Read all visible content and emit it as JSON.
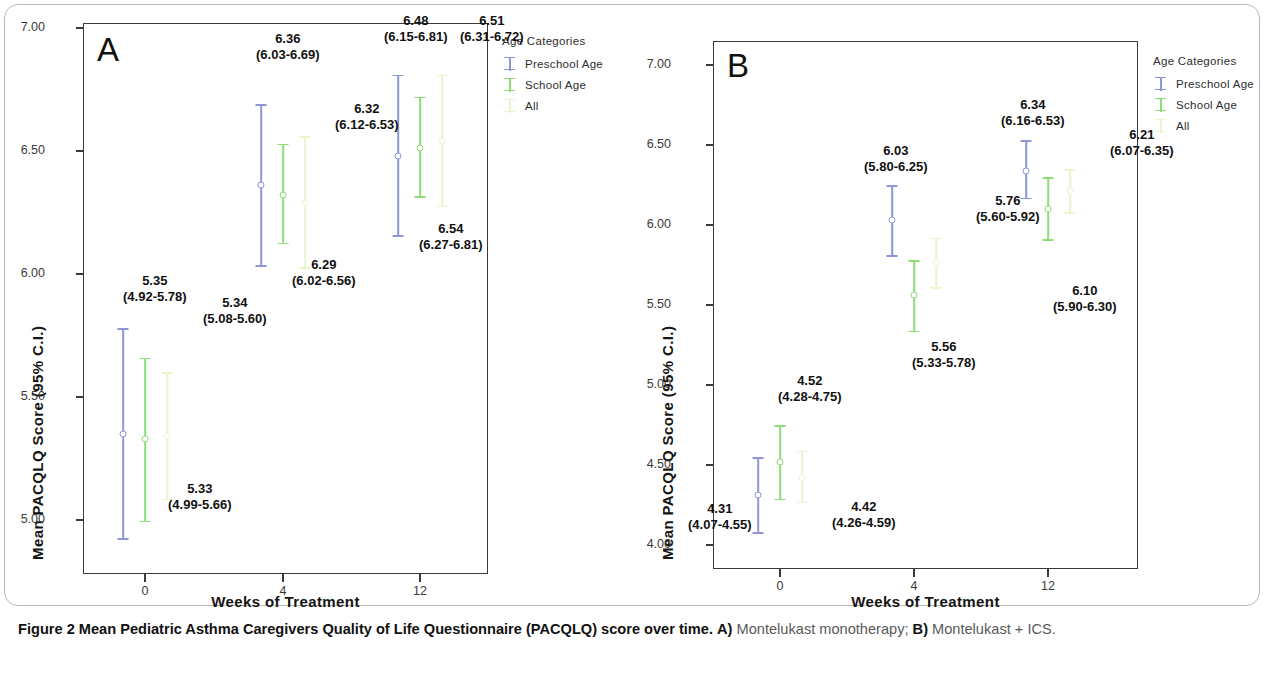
{
  "figure": {
    "caption_bold_lead": "Figure 2",
    "caption_bold_main": "Mean Pediatric Asthma Caregivers Quality of Life Questionnaire (PACQLQ) score over time.",
    "caption_a_bold": "A)",
    "caption_a_text": "Montelukast monotherapy;",
    "caption_b_bold": "B)",
    "caption_b_text": "Montelukast + ICS."
  },
  "colors": {
    "preschool": "#8f96d6",
    "school": "#8ddd77",
    "all": "#e9f5cf",
    "axis": "#3b3b3b",
    "text": "#111111"
  },
  "legend": {
    "title": "Age Categories",
    "items": [
      {
        "label": "Preschool Age",
        "color_key": "preschool"
      },
      {
        "label": "School Age",
        "color_key": "school"
      },
      {
        "label": "All",
        "color_key": "all"
      }
    ]
  },
  "axes": {
    "xlabel": "Weeks of Treatment",
    "ylabel": "Mean PACQLQ Score (95% C.I.)",
    "xticks": [
      "0",
      "4",
      "12"
    ],
    "panel_a_yticks": [
      "7.00",
      "6.50",
      "6.00",
      "5.50",
      "5.00"
    ],
    "panel_b_yticks": [
      "7.00",
      "6.50",
      "6.00",
      "5.50",
      "5.00",
      "4.50",
      "4.00"
    ]
  },
  "panels": {
    "a": {
      "letter": "A"
    },
    "b": {
      "letter": "B"
    }
  },
  "chart_data": [
    {
      "id": "panel-a",
      "type": "scatter",
      "title": "A) Montelukast monotherapy",
      "xlabel": "Weeks of Treatment",
      "ylabel": "Mean PACQLQ Score (95% C.I.)",
      "xlim": [
        -1.2,
        2.2
      ],
      "ylim": [
        4.78,
        7.02
      ],
      "x": [
        0,
        4,
        12
      ],
      "xtick_labels": [
        "0",
        "4",
        "12"
      ],
      "ytick_labels": [
        "5.00",
        "5.50",
        "6.00",
        "6.50",
        "7.00"
      ],
      "grid": false,
      "legend_position": "right",
      "series": [
        {
          "name": "Preschool Age",
          "color": "#8f96d6",
          "values": [
            5.35,
            6.36,
            6.48
          ],
          "ci_low": [
            4.92,
            6.03,
            6.15
          ],
          "ci_high": [
            5.78,
            6.69,
            6.81
          ],
          "labels": [
            "5.35",
            "6.36",
            "6.48"
          ],
          "ci_labels": [
            "(4.92-5.78)",
            "(6.03-6.69)",
            "(6.15-6.81)"
          ]
        },
        {
          "name": "School Age",
          "color": "#8ddd77",
          "values": [
            5.33,
            6.32,
            6.51
          ],
          "ci_low": [
            4.99,
            6.12,
            6.31
          ],
          "ci_high": [
            5.66,
            6.53,
            6.72
          ],
          "labels": [
            "5.33",
            "6.32",
            "6.51"
          ],
          "ci_labels": [
            "(4.99-5.66)",
            "(6.12-6.53)",
            "(6.31-6.72)"
          ]
        },
        {
          "name": "All",
          "color": "#e9f5cf",
          "values": [
            5.34,
            6.29,
            6.54
          ],
          "ci_low": [
            5.08,
            6.02,
            6.27
          ],
          "ci_high": [
            5.6,
            6.56,
            6.81
          ],
          "labels": [
            "5.34",
            "6.29",
            "6.54"
          ],
          "ci_labels": [
            "(5.08-5.60)",
            "(6.02-6.56)",
            "(6.27-6.81)"
          ]
        }
      ]
    },
    {
      "id": "panel-b",
      "type": "scatter",
      "title": "B) Montelukast + ICS",
      "xlabel": "Weeks of Treatment",
      "ylabel": "Mean PACQLQ Score (95% C.I.)",
      "xlim": [
        -1.2,
        2.2
      ],
      "ylim": [
        3.85,
        7.15
      ],
      "x": [
        0,
        4,
        12
      ],
      "xtick_labels": [
        "0",
        "4",
        "12"
      ],
      "ytick_labels": [
        "4.00",
        "4.50",
        "5.00",
        "5.50",
        "6.00",
        "6.50",
        "7.00"
      ],
      "grid": false,
      "legend_position": "right",
      "series": [
        {
          "name": "Preschool Age",
          "color": "#8f96d6",
          "values": [
            4.31,
            6.03,
            6.34
          ],
          "ci_low": [
            4.07,
            5.8,
            6.16
          ],
          "ci_high": [
            4.55,
            6.25,
            6.53
          ],
          "labels": [
            "4.31",
            "6.03",
            "6.34"
          ],
          "ci_labels": [
            "(4.07-4.55)",
            "(5.80-6.25)",
            "(6.16-6.53)"
          ]
        },
        {
          "name": "School Age",
          "color": "#8ddd77",
          "values": [
            4.52,
            5.56,
            6.1
          ],
          "ci_low": [
            4.28,
            5.33,
            5.9
          ],
          "ci_high": [
            4.75,
            5.78,
            6.3
          ],
          "labels": [
            "4.52",
            "5.56",
            "6.10"
          ],
          "ci_labels": [
            "(4.28-4.75)",
            "(5.33-5.78)",
            "(5.90-6.30)"
          ]
        },
        {
          "name": "All",
          "color": "#e9f5cf",
          "values": [
            4.42,
            5.76,
            6.21
          ],
          "ci_low": [
            4.26,
            5.6,
            6.07
          ],
          "ci_high": [
            4.59,
            5.92,
            6.35
          ],
          "labels": [
            "4.42",
            "5.76",
            "6.21"
          ],
          "ci_labels": [
            "(4.26-4.59)",
            "(5.60-5.92)",
            "(6.07-6.35)"
          ]
        }
      ]
    }
  ],
  "annotations": {
    "panel_a": [
      {
        "text": "5.35",
        "ci": "(4.92-5.78)",
        "x": 118,
        "y": 268
      },
      {
        "text": "5.33",
        "ci": "(4.99-5.66)",
        "x": 163,
        "y": 476
      },
      {
        "text": "5.34",
        "ci": "(5.08-5.60)",
        "x": 198,
        "y": 290
      },
      {
        "text": "6.36",
        "ci": "(6.03-6.69)",
        "x": 251,
        "y": 26
      },
      {
        "text": "6.32",
        "ci": "(6.12-6.53)",
        "x": 330,
        "y": 96
      },
      {
        "text": "6.29",
        "ci": "(6.02-6.56)",
        "x": 287,
        "y": 252
      },
      {
        "text": "6.48",
        "ci": "(6.15-6.81)",
        "x": 379,
        "y": 8
      },
      {
        "text": "6.51",
        "ci": "(6.31-6.72)",
        "x": 455,
        "y": 8
      },
      {
        "text": "6.54",
        "ci": "(6.27-6.81)",
        "x": 414,
        "y": 216
      }
    ],
    "panel_b": [
      {
        "text": "4.31",
        "ci": "(4.07-4.55)",
        "x": 53,
        "y": 496
      },
      {
        "text": "4.52",
        "ci": "(4.28-4.75)",
        "x": 143,
        "y": 368
      },
      {
        "text": "4.42",
        "ci": "(4.26-4.59)",
        "x": 197,
        "y": 494
      },
      {
        "text": "6.03",
        "ci": "(5.80-6.25)",
        "x": 229,
        "y": 138
      },
      {
        "text": "5.56",
        "ci": "(5.33-5.78)",
        "x": 277,
        "y": 334
      },
      {
        "text": "5.76",
        "ci": "(5.60-5.92)",
        "x": 341,
        "y": 188
      },
      {
        "text": "6.34",
        "ci": "(6.16-6.53)",
        "x": 366,
        "y": 92
      },
      {
        "text": "6.10",
        "ci": "(5.90-6.30)",
        "x": 418,
        "y": 278
      },
      {
        "text": "6.21",
        "ci": "(6.07-6.35)",
        "x": 475,
        "y": 122
      }
    ]
  }
}
